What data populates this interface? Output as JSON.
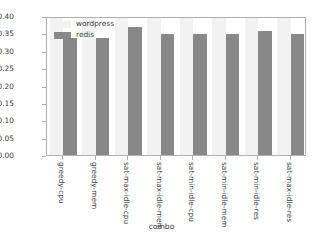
{
  "chart_data": {
    "type": "bar",
    "title": "",
    "xlabel": "combo",
    "ylabel": "",
    "ylim": [
      0.0,
      0.4
    ],
    "yticks": [
      "0.00",
      "0.05",
      "0.10",
      "0.15",
      "0.20",
      "0.25",
      "0.30",
      "0.35",
      "0.40"
    ],
    "ytick_values": [
      0.0,
      0.05,
      0.1,
      0.15,
      0.2,
      0.25,
      0.3,
      0.35,
      0.4
    ],
    "grid": false,
    "legend_position": "upper-left",
    "categories": [
      "greedy-cpu",
      "greedy-mem",
      "sat-max-idle-cpu",
      "sat-max-idle-mem",
      "sat-min-idle-cpu",
      "sat-min-idle-mem",
      "sat-min-idle-res",
      "sat-max-idle-res"
    ],
    "series": [
      {
        "name": "wordpress",
        "color": "#f2f2f2",
        "values": [
          0.399,
          0.399,
          0.396,
          0.397,
          0.397,
          0.397,
          0.398,
          0.404
        ]
      },
      {
        "name": "redis",
        "color": "#888888",
        "values": [
          0.338,
          0.338,
          0.368,
          0.349,
          0.348,
          0.348,
          0.358,
          0.348
        ]
      }
    ]
  },
  "legend": {
    "items": [
      {
        "label": "wordpress",
        "swatch_class": "wordpress"
      },
      {
        "label": "redis",
        "swatch_class": "redis"
      }
    ]
  },
  "axis": {
    "xlabel": "combo"
  }
}
